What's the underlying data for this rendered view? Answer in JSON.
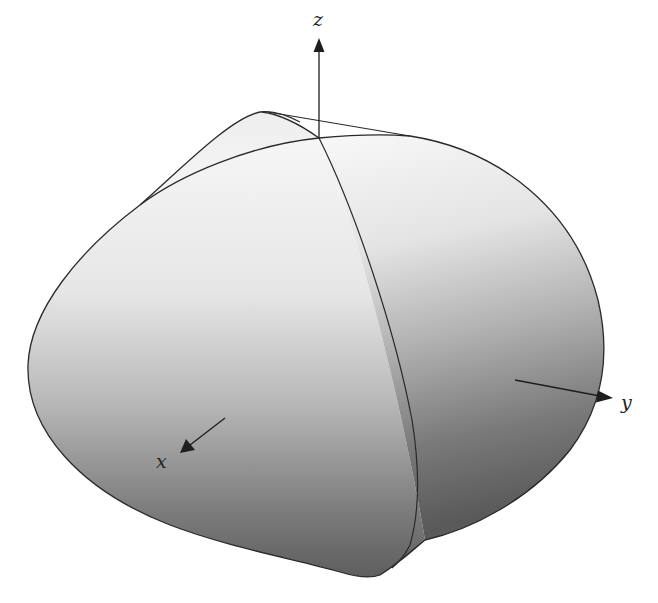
{
  "figure": {
    "colors": {
      "background": "#ffffff",
      "surface_light": "#f4f4f4",
      "surface_mid": "#cfcfcf",
      "surface_dark": "#6e6e6e",
      "outline": "#2a2a2a",
      "axis": "#1e1e1e"
    }
  },
  "axes": {
    "z": {
      "label": "z"
    },
    "y": {
      "label": "y"
    },
    "x": {
      "label": "x"
    }
  }
}
